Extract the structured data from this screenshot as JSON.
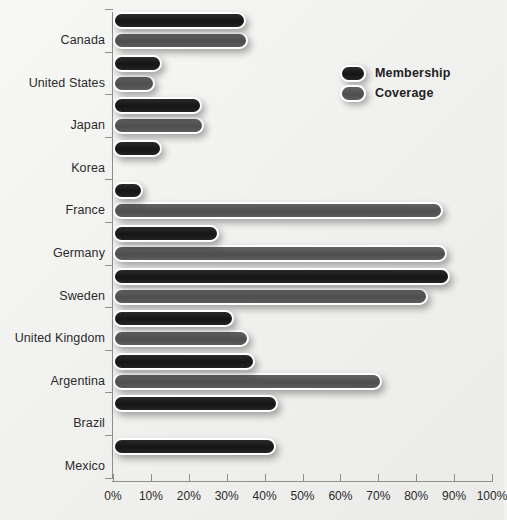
{
  "chart_data": {
    "type": "bar",
    "orientation": "horizontal",
    "title": "",
    "xlabel": "",
    "ylabel": "",
    "xlim": [
      0,
      100
    ],
    "grid": false,
    "legend_position": "top-right",
    "tick_suffix": "%",
    "categories": [
      "Canada",
      "United States",
      "Japan",
      "Korea",
      "France",
      "Germany",
      "Sweden",
      "United Kingdom",
      "Argentina",
      "Brazil",
      "Mexico"
    ],
    "xticks": [
      0,
      10,
      20,
      30,
      40,
      50,
      60,
      70,
      80,
      90,
      100
    ],
    "xticklabels": [
      "0%",
      "10%",
      "20%",
      "30%",
      "40%",
      "50%",
      "60%",
      "70%",
      "80%",
      "90%",
      "100%"
    ],
    "series": [
      {
        "name": "Membership",
        "color": "#1b1b1b",
        "values": [
          35,
          13,
          23.5,
          13,
          8,
          28,
          89,
          32,
          37.5,
          43.5,
          43
        ]
      },
      {
        "name": "Coverage",
        "color": "#565656",
        "values": [
          35.5,
          11,
          24,
          null,
          87,
          88,
          83,
          36,
          71,
          null,
          null
        ]
      }
    ]
  },
  "legend": {
    "items": [
      {
        "label": "Membership",
        "swatch": "membership-swatch"
      },
      {
        "label": "Coverage",
        "swatch": "coverage-swatch"
      }
    ]
  }
}
